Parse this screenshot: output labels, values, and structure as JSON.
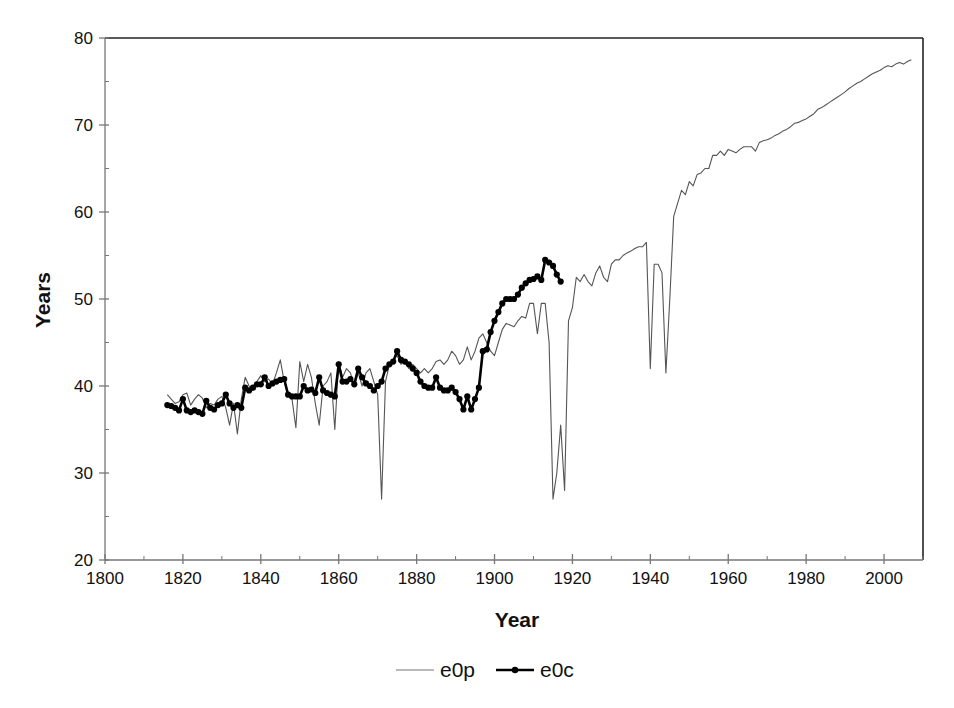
{
  "chart_data": {
    "type": "line",
    "title": "",
    "xlabel": "Year",
    "ylabel": "Years",
    "xlim": [
      1800,
      2010
    ],
    "ylim": [
      20,
      80
    ],
    "x_ticks": [
      1800,
      1820,
      1840,
      1860,
      1880,
      1900,
      1920,
      1940,
      1960,
      1980,
      2000
    ],
    "y_ticks": [
      20,
      30,
      40,
      50,
      60,
      70,
      80
    ],
    "grid": false,
    "legend_position": "bottom",
    "series": [
      {
        "name": "e0p",
        "style": "thin-line",
        "color": "#555555",
        "points": [
          [
            1816,
            39.0
          ],
          [
            1817,
            38.5
          ],
          [
            1818,
            38.0
          ],
          [
            1819,
            38.2
          ],
          [
            1820,
            39.0
          ],
          [
            1821,
            39.2
          ],
          [
            1822,
            37.8
          ],
          [
            1823,
            38.5
          ],
          [
            1824,
            39.0
          ],
          [
            1825,
            38.6
          ],
          [
            1826,
            37.5
          ],
          [
            1827,
            38.0
          ],
          [
            1828,
            37.8
          ],
          [
            1829,
            38.5
          ],
          [
            1830,
            38.8
          ],
          [
            1831,
            37.5
          ],
          [
            1832,
            35.5
          ],
          [
            1833,
            38.0
          ],
          [
            1834,
            34.5
          ],
          [
            1835,
            38.5
          ],
          [
            1836,
            41.0
          ],
          [
            1837,
            40.0
          ],
          [
            1838,
            39.5
          ],
          [
            1839,
            40.5
          ],
          [
            1840,
            41.2
          ],
          [
            1841,
            40.5
          ],
          [
            1842,
            40.8
          ],
          [
            1843,
            40.2
          ],
          [
            1844,
            41.5
          ],
          [
            1845,
            43.0
          ],
          [
            1846,
            40.5
          ],
          [
            1847,
            39.0
          ],
          [
            1848,
            38.5
          ],
          [
            1849,
            35.2
          ],
          [
            1850,
            42.8
          ],
          [
            1851,
            40.5
          ],
          [
            1852,
            42.5
          ],
          [
            1853,
            41.0
          ],
          [
            1854,
            38.0
          ],
          [
            1855,
            35.5
          ],
          [
            1856,
            40.0
          ],
          [
            1857,
            40.5
          ],
          [
            1858,
            41.5
          ],
          [
            1859,
            35.0
          ],
          [
            1860,
            42.8
          ],
          [
            1861,
            41.0
          ],
          [
            1862,
            42.0
          ],
          [
            1863,
            41.5
          ],
          [
            1864,
            40.0
          ],
          [
            1865,
            41.5
          ],
          [
            1866,
            40.0
          ],
          [
            1867,
            41.5
          ],
          [
            1868,
            42.0
          ],
          [
            1869,
            40.5
          ],
          [
            1870,
            39.0
          ],
          [
            1871,
            27.0
          ],
          [
            1872,
            40.5
          ],
          [
            1873,
            42.5
          ],
          [
            1874,
            43.0
          ],
          [
            1875,
            43.5
          ],
          [
            1876,
            42.5
          ],
          [
            1877,
            43.0
          ],
          [
            1878,
            42.0
          ],
          [
            1879,
            42.5
          ],
          [
            1880,
            42.0
          ],
          [
            1881,
            41.5
          ],
          [
            1882,
            42.0
          ],
          [
            1883,
            41.5
          ],
          [
            1884,
            42.0
          ],
          [
            1885,
            42.8
          ],
          [
            1886,
            43.0
          ],
          [
            1887,
            42.5
          ],
          [
            1888,
            43.0
          ],
          [
            1889,
            44.0
          ],
          [
            1890,
            43.5
          ],
          [
            1891,
            42.5
          ],
          [
            1892,
            43.0
          ],
          [
            1893,
            44.5
          ],
          [
            1894,
            43.0
          ],
          [
            1895,
            44.0
          ],
          [
            1896,
            45.5
          ],
          [
            1897,
            46.0
          ],
          [
            1898,
            45.0
          ],
          [
            1899,
            44.0
          ],
          [
            1900,
            43.5
          ],
          [
            1901,
            45.0
          ],
          [
            1902,
            46.5
          ],
          [
            1903,
            47.2
          ],
          [
            1904,
            47.0
          ],
          [
            1905,
            46.8
          ],
          [
            1906,
            47.5
          ],
          [
            1907,
            48.0
          ],
          [
            1908,
            47.8
          ],
          [
            1909,
            49.5
          ],
          [
            1910,
            49.5
          ],
          [
            1911,
            46.0
          ],
          [
            1912,
            49.5
          ],
          [
            1913,
            49.5
          ],
          [
            1914,
            45.0
          ],
          [
            1915,
            27.0
          ],
          [
            1916,
            30.0
          ],
          [
            1917,
            35.5
          ],
          [
            1918,
            28.0
          ],
          [
            1919,
            47.5
          ],
          [
            1920,
            49.0
          ],
          [
            1921,
            52.5
          ],
          [
            1922,
            52.0
          ],
          [
            1923,
            52.8
          ],
          [
            1924,
            52.0
          ],
          [
            1925,
            51.5
          ],
          [
            1926,
            53.0
          ],
          [
            1927,
            53.8
          ],
          [
            1928,
            52.5
          ],
          [
            1929,
            52.0
          ],
          [
            1930,
            54.0
          ],
          [
            1931,
            54.5
          ],
          [
            1932,
            54.5
          ],
          [
            1933,
            55.0
          ],
          [
            1934,
            55.3
          ],
          [
            1935,
            55.5
          ],
          [
            1936,
            55.8
          ],
          [
            1937,
            56.0
          ],
          [
            1938,
            56.0
          ],
          [
            1939,
            56.5
          ],
          [
            1940,
            42.0
          ],
          [
            1941,
            54.0
          ],
          [
            1942,
            54.0
          ],
          [
            1943,
            53.0
          ],
          [
            1944,
            41.5
          ],
          [
            1945,
            50.0
          ],
          [
            1946,
            59.5
          ],
          [
            1947,
            61.0
          ],
          [
            1948,
            62.5
          ],
          [
            1949,
            62.0
          ],
          [
            1950,
            63.5
          ],
          [
            1951,
            63.0
          ],
          [
            1952,
            64.3
          ],
          [
            1953,
            64.5
          ],
          [
            1954,
            65.0
          ],
          [
            1955,
            65.0
          ],
          [
            1956,
            66.5
          ],
          [
            1957,
            66.5
          ],
          [
            1958,
            67.0
          ],
          [
            1959,
            66.5
          ],
          [
            1960,
            67.2
          ],
          [
            1961,
            67.0
          ],
          [
            1962,
            66.8
          ],
          [
            1963,
            67.2
          ],
          [
            1964,
            67.5
          ],
          [
            1965,
            67.5
          ],
          [
            1966,
            67.5
          ],
          [
            1967,
            67.0
          ],
          [
            1968,
            68.0
          ],
          [
            1969,
            68.2
          ],
          [
            1970,
            68.3
          ],
          [
            1971,
            68.5
          ],
          [
            1972,
            68.8
          ],
          [
            1973,
            69.0
          ],
          [
            1974,
            69.3
          ],
          [
            1975,
            69.5
          ],
          [
            1976,
            69.8
          ],
          [
            1977,
            70.2
          ],
          [
            1978,
            70.3
          ],
          [
            1979,
            70.5
          ],
          [
            1980,
            70.7
          ],
          [
            1981,
            71.0
          ],
          [
            1982,
            71.3
          ],
          [
            1983,
            71.8
          ],
          [
            1984,
            72.0
          ],
          [
            1985,
            72.3
          ],
          [
            1986,
            72.6
          ],
          [
            1987,
            72.9
          ],
          [
            1988,
            73.2
          ],
          [
            1989,
            73.5
          ],
          [
            1990,
            73.8
          ],
          [
            1991,
            74.2
          ],
          [
            1992,
            74.5
          ],
          [
            1993,
            74.8
          ],
          [
            1994,
            75.0
          ],
          [
            1995,
            75.3
          ],
          [
            1996,
            75.6
          ],
          [
            1997,
            75.9
          ],
          [
            1998,
            76.1
          ],
          [
            1999,
            76.3
          ],
          [
            2000,
            76.6
          ],
          [
            2001,
            76.8
          ],
          [
            2002,
            76.7
          ],
          [
            2003,
            77.0
          ],
          [
            2004,
            77.2
          ],
          [
            2005,
            77.0
          ],
          [
            2006,
            77.3
          ],
          [
            2007,
            77.5
          ]
        ]
      },
      {
        "name": "e0c",
        "style": "thick-line-with-markers",
        "color": "#000000",
        "points": [
          [
            1816,
            37.8
          ],
          [
            1817,
            37.7
          ],
          [
            1818,
            37.5
          ],
          [
            1819,
            37.2
          ],
          [
            1820,
            38.5
          ],
          [
            1821,
            37.2
          ],
          [
            1822,
            37.0
          ],
          [
            1823,
            37.2
          ],
          [
            1824,
            37.0
          ],
          [
            1825,
            36.8
          ],
          [
            1826,
            38.3
          ],
          [
            1827,
            37.5
          ],
          [
            1828,
            37.3
          ],
          [
            1829,
            37.8
          ],
          [
            1830,
            38.0
          ],
          [
            1831,
            39.0
          ],
          [
            1832,
            38.0
          ],
          [
            1833,
            37.5
          ],
          [
            1834,
            37.8
          ],
          [
            1835,
            37.5
          ],
          [
            1836,
            39.8
          ],
          [
            1837,
            39.5
          ],
          [
            1838,
            39.8
          ],
          [
            1839,
            40.2
          ],
          [
            1840,
            40.2
          ],
          [
            1841,
            41.0
          ],
          [
            1842,
            40.0
          ],
          [
            1843,
            40.3
          ],
          [
            1844,
            40.5
          ],
          [
            1845,
            40.7
          ],
          [
            1846,
            40.8
          ],
          [
            1847,
            39.0
          ],
          [
            1848,
            38.8
          ],
          [
            1849,
            38.8
          ],
          [
            1850,
            38.8
          ],
          [
            1851,
            40.0
          ],
          [
            1852,
            39.5
          ],
          [
            1853,
            39.6
          ],
          [
            1854,
            39.2
          ],
          [
            1855,
            41.0
          ],
          [
            1856,
            39.5
          ],
          [
            1857,
            39.2
          ],
          [
            1858,
            39.0
          ],
          [
            1859,
            38.8
          ],
          [
            1860,
            42.5
          ],
          [
            1861,
            40.5
          ],
          [
            1862,
            40.5
          ],
          [
            1863,
            40.8
          ],
          [
            1864,
            40.2
          ],
          [
            1865,
            42.0
          ],
          [
            1866,
            41.0
          ],
          [
            1867,
            40.3
          ],
          [
            1868,
            40.0
          ],
          [
            1869,
            39.5
          ],
          [
            1870,
            40.0
          ],
          [
            1871,
            40.5
          ],
          [
            1872,
            42.0
          ],
          [
            1873,
            42.5
          ],
          [
            1874,
            42.8
          ],
          [
            1875,
            44.0
          ],
          [
            1876,
            43.0
          ],
          [
            1877,
            42.8
          ],
          [
            1878,
            42.5
          ],
          [
            1879,
            42.0
          ],
          [
            1880,
            41.5
          ],
          [
            1881,
            40.5
          ],
          [
            1882,
            40.0
          ],
          [
            1883,
            39.8
          ],
          [
            1884,
            39.8
          ],
          [
            1885,
            41.0
          ],
          [
            1886,
            39.8
          ],
          [
            1887,
            39.5
          ],
          [
            1888,
            39.5
          ],
          [
            1889,
            39.8
          ],
          [
            1890,
            39.3
          ],
          [
            1891,
            38.5
          ],
          [
            1892,
            37.3
          ],
          [
            1893,
            38.8
          ],
          [
            1894,
            37.3
          ],
          [
            1895,
            38.5
          ],
          [
            1896,
            39.8
          ],
          [
            1897,
            44.0
          ],
          [
            1898,
            44.2
          ],
          [
            1899,
            46.2
          ],
          [
            1900,
            47.5
          ],
          [
            1901,
            48.5
          ],
          [
            1902,
            49.5
          ],
          [
            1903,
            50.0
          ],
          [
            1904,
            50.0
          ],
          [
            1905,
            50.0
          ],
          [
            1906,
            50.5
          ],
          [
            1907,
            51.3
          ],
          [
            1908,
            51.8
          ],
          [
            1909,
            52.2
          ],
          [
            1910,
            52.3
          ],
          [
            1911,
            52.6
          ],
          [
            1912,
            52.2
          ],
          [
            1913,
            54.5
          ],
          [
            1914,
            54.2
          ],
          [
            1915,
            53.8
          ],
          [
            1916,
            52.8
          ],
          [
            1917,
            52.0
          ]
        ]
      }
    ]
  },
  "legend": {
    "items": [
      {
        "label": "e0p"
      },
      {
        "label": "e0c"
      }
    ]
  }
}
